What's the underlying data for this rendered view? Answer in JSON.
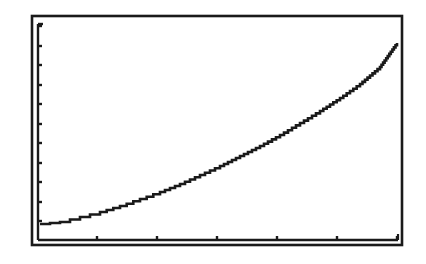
{
  "screen": {
    "description": "Calculator-style graph display window",
    "background": "#ffffff",
    "ink": "#1a1a1a"
  },
  "frame": {
    "outer": {
      "x": 32,
      "y": 16,
      "w": 370,
      "h": 229
    },
    "inner": {
      "x": 38,
      "y": 24,
      "w": 360,
      "h": 216
    }
  },
  "axes": {
    "y_axis": {
      "position": "left",
      "tick_pixel_y": [
        26,
        46,
        65,
        85,
        104,
        124,
        143,
        163,
        182,
        202,
        221
      ],
      "labels": []
    },
    "x_axis": {
      "position": "bottom",
      "tick_pixel_x": [
        97,
        157,
        217,
        277,
        337,
        397
      ],
      "labels": []
    }
  },
  "chart_data": {
    "type": "line",
    "title": "",
    "xlabel": "",
    "ylabel": "",
    "grid": false,
    "legend": null,
    "xlim": [
      0,
      6
    ],
    "ylim": [
      0,
      11
    ],
    "x_ticks": [
      1,
      2,
      3,
      4,
      5,
      6
    ],
    "y_ticks": [
      1,
      2,
      3,
      4,
      5,
      6,
      7,
      8,
      9,
      10,
      11
    ],
    "series": [
      {
        "name": "curve",
        "style": "pixel-stepped",
        "x": [
          0.03,
          0.37,
          0.7,
          1.03,
          1.37,
          1.7,
          2.03,
          2.37,
          2.7,
          3.03,
          3.37,
          3.7,
          4.03,
          4.37,
          4.7,
          5.03,
          5.37,
          5.7,
          5.98
        ],
        "y": [
          0.8,
          0.9,
          1.2,
          1.4,
          1.7,
          2.1,
          2.4,
          2.8,
          3.3,
          3.8,
          4.3,
          4.8,
          5.4,
          6.0,
          6.6,
          7.2,
          7.9,
          8.7,
          9.9
        ]
      }
    ],
    "pixel_points": [
      [
        40,
        224
      ],
      [
        60,
        222
      ],
      [
        80,
        217
      ],
      [
        100,
        212
      ],
      [
        120,
        206
      ],
      [
        140,
        199
      ],
      [
        160,
        192
      ],
      [
        180,
        184
      ],
      [
        200,
        175
      ],
      [
        220,
        166
      ],
      [
        240,
        156
      ],
      [
        260,
        146
      ],
      [
        280,
        135
      ],
      [
        300,
        123
      ],
      [
        320,
        111
      ],
      [
        340,
        98
      ],
      [
        360,
        84
      ],
      [
        380,
        67
      ],
      [
        397,
        43
      ]
    ]
  }
}
